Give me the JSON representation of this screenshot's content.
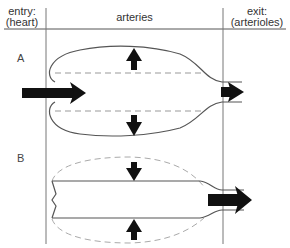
{
  "headers": {
    "entry_line1": "entry:",
    "entry_line2": "(heart)",
    "middle": "arteries",
    "exit_line1": "exit:",
    "exit_line2": "(arterioles)"
  },
  "sections": [
    {
      "id": "A",
      "label": "A",
      "description": "artery expanded (outward pressure arrows), dashed lines show resting wall position; blood enters from heart"
    },
    {
      "id": "B",
      "label": "B",
      "description": "artery recoils (inward pressure arrows), dashed ellipse shows expanded wall position; blood pushed toward arterioles"
    }
  ],
  "colors": {
    "line": "#555555",
    "dashed": "#999999",
    "arrow": "#111111",
    "background": "#ffffff"
  }
}
